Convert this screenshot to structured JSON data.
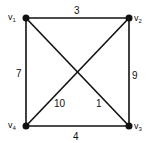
{
  "graph": {
    "vertices": [
      {
        "id": "v1",
        "name": "v",
        "sub": "1"
      },
      {
        "id": "v2",
        "name": "v",
        "sub": "2"
      },
      {
        "id": "v3",
        "name": "v",
        "sub": "3"
      },
      {
        "id": "v4",
        "name": "v",
        "sub": "4"
      }
    ],
    "edges": [
      {
        "from": "v1",
        "to": "v2",
        "weight": "3"
      },
      {
        "from": "v2",
        "to": "v3",
        "weight": "9"
      },
      {
        "from": "v3",
        "to": "v4",
        "weight": "4"
      },
      {
        "from": "v4",
        "to": "v1",
        "weight": "7"
      },
      {
        "from": "v4",
        "to": "v2",
        "weight": "10"
      },
      {
        "from": "v1",
        "to": "v3",
        "weight": "1"
      }
    ],
    "colors": {
      "ink": "#111111",
      "background": "#ffffff"
    }
  }
}
